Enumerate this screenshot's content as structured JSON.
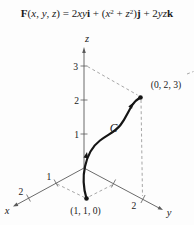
{
  "formula": {
    "segments": [
      {
        "text": "F",
        "style": "bd"
      },
      {
        "text": "(",
        "style": ""
      },
      {
        "text": "x",
        "style": "it"
      },
      {
        "text": ", ",
        "style": ""
      },
      {
        "text": "y",
        "style": "it"
      },
      {
        "text": ", ",
        "style": ""
      },
      {
        "text": "z",
        "style": "it"
      },
      {
        "text": ") = 2",
        "style": ""
      },
      {
        "text": "xy",
        "style": "it"
      },
      {
        "text": "i",
        "style": "bd"
      },
      {
        "text": " + (",
        "style": ""
      },
      {
        "text": "x",
        "style": "it"
      },
      {
        "text": "2",
        "style": "sup"
      },
      {
        "text": " + ",
        "style": ""
      },
      {
        "text": "z",
        "style": "it"
      },
      {
        "text": "2",
        "style": "sup"
      },
      {
        "text": ")",
        "style": ""
      },
      {
        "text": "j",
        "style": "bd"
      },
      {
        "text": " + 2",
        "style": ""
      },
      {
        "text": "yz",
        "style": "it"
      },
      {
        "text": "k",
        "style": "bd"
      }
    ]
  },
  "diagram": {
    "axes": {
      "x": {
        "label": "x",
        "ticks": [
          "1",
          "2"
        ]
      },
      "y": {
        "label": "y",
        "ticks": [
          "2"
        ]
      },
      "z": {
        "label": "z",
        "ticks": [
          "1",
          "2",
          "3"
        ]
      }
    },
    "curve": {
      "label": "C"
    },
    "points": {
      "start": {
        "label": "(1, 1, 0)",
        "coords": [
          1,
          1,
          0
        ]
      },
      "end": {
        "label": "(0, 2, 3)",
        "coords": [
          0,
          2,
          3
        ]
      }
    },
    "colors": {
      "curve": "#151515",
      "axis": "#5a5a5a",
      "dashed": "#8f8f8f",
      "text": "#1a1a1a"
    }
  }
}
